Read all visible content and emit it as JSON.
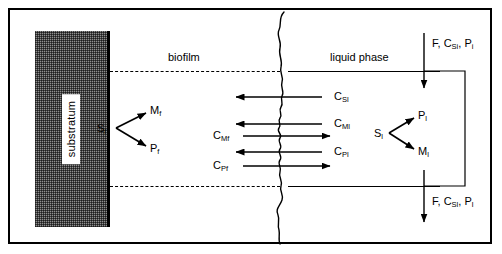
{
  "figure": {
    "type": "diagram"
  },
  "regions": {
    "substratum_label": "substratum",
    "biofilm_label": "biofilm",
    "liquid_label": "liquid phase"
  },
  "biofilm_reaction": {
    "reactant": "S",
    "reactant_sub": "f",
    "product_top": "M",
    "product_top_sub": "f",
    "product_bottom": "P",
    "product_bottom_sub": "f"
  },
  "liquid_reaction": {
    "reactant": "S",
    "reactant_sub": "l",
    "product_top": "P",
    "product_top_sub": "l",
    "product_bottom": "M",
    "product_bottom_sub": "l"
  },
  "transfer_labels": {
    "right_top": {
      "symbol": "C",
      "sub": "Sl"
    },
    "right_mid": {
      "symbol": "C",
      "sub": "Ml"
    },
    "right_bottom": {
      "symbol": "C",
      "sub": "Pl"
    },
    "left_mid": {
      "symbol": "C",
      "sub": "Mf"
    },
    "left_bottom": {
      "symbol": "C",
      "sub": "Pf"
    }
  },
  "flows": {
    "inlet": {
      "flow": "F",
      "conc": "C",
      "conc_sub": "Si",
      "product": "P",
      "product_sub": "i"
    },
    "outlet": {
      "flow": "F",
      "conc": "C",
      "conc_sub": "Sl",
      "product": "P",
      "product_sub": "l"
    }
  },
  "colors": {
    "line": "#000000",
    "substratum_fill": "#8f8f8f",
    "background": "#ffffff"
  }
}
